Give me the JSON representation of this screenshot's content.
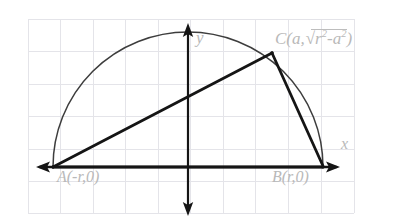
{
  "figure": {
    "style": "hand-drawn pencil sketch on graph paper",
    "background_color": "#ffffff",
    "grid_color": "#e3e3e8",
    "ink_color": "#1b1b1b",
    "curve_color": "#3a3a3a",
    "label_color": "#b9b9b9"
  },
  "grid": {
    "visible": true,
    "left": 28,
    "top": 19,
    "right": 354,
    "bottom": 213,
    "cell_size": 32.4,
    "cols": 10,
    "rows": 6
  },
  "axes": {
    "x_label": "x",
    "y_label": "y",
    "x_axis": {
      "y": 167,
      "x_start": 36,
      "x_end": 340,
      "arrow_start": true,
      "arrow_end": true
    },
    "y_axis": {
      "x": 188,
      "y_start": 24,
      "y_end": 216,
      "arrow_start": true,
      "arrow_end": true
    }
  },
  "points": [
    {
      "id": "A",
      "label": "A(-r,0)",
      "x": 53,
      "y": 167
    },
    {
      "id": "B",
      "label": "B(r,0)",
      "x": 323,
      "y": 167
    },
    {
      "id": "C",
      "label_prefix": "C(a,",
      "label_radicand_base": "r",
      "label_radicand_exp": "2",
      "label_minus": "-",
      "label_radicand_base2": "a",
      "label_radicand_exp2": "2",
      "label_suffix": ")",
      "x": 272,
      "y": 53
    }
  ],
  "point_C_label_plain": "C(a,√(r²-a²))",
  "semicircle": {
    "center_x": 188,
    "center_y": 167,
    "radius": 135,
    "start_angle_deg": 180,
    "end_angle_deg": 0
  },
  "segments": [
    {
      "name": "AC",
      "from": "A",
      "to": "C"
    },
    {
      "name": "CB",
      "from": "C",
      "to": "B"
    },
    {
      "name": "AB",
      "from": "A",
      "to": "B"
    }
  ]
}
